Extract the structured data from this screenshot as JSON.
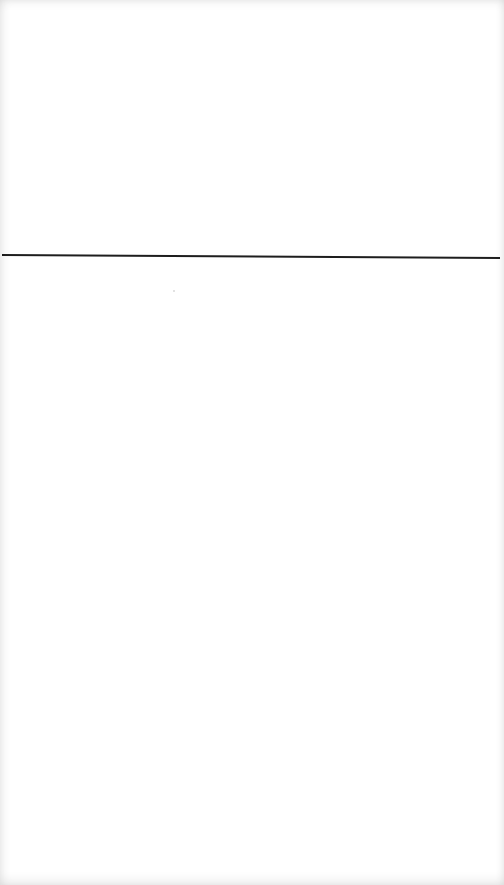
{
  "page": {
    "background_color": "#ffffff",
    "text_blocks": []
  },
  "rule": {
    "color": "#1e1e1e",
    "y_left": 255,
    "y_right": 258
  }
}
